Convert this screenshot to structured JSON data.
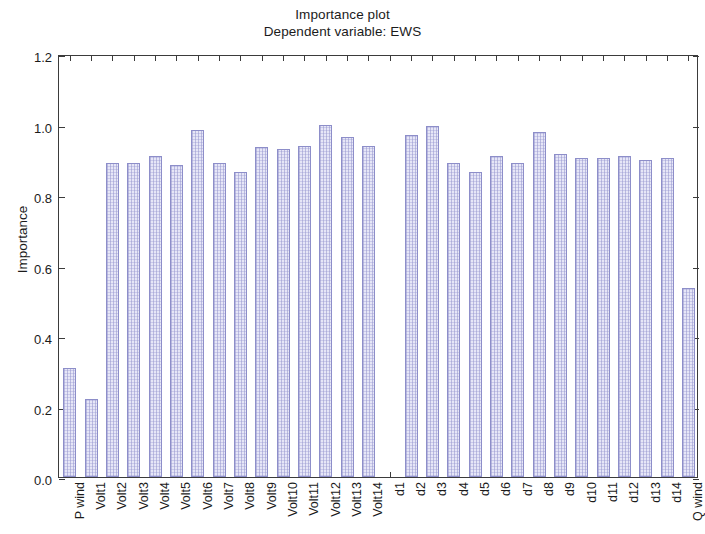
{
  "chart_data": {
    "type": "bar",
    "title": "Importance plot",
    "subtitle": "Dependent variable: EWS",
    "xlabel": "",
    "ylabel": "Importance",
    "ylim": [
      0.0,
      1.2
    ],
    "yticks": [
      "0.0",
      "0.2",
      "0.4",
      "0.6",
      "0.8",
      "1.0",
      "1.2"
    ],
    "ytick_values": [
      0.0,
      0.2,
      0.4,
      0.6,
      0.8,
      1.0,
      1.2
    ],
    "grid": false,
    "legend": "none",
    "bar_fill_color": "#e6e6f7",
    "bar_edge_color": "#8d8ec9",
    "categories": [
      "P wind",
      "Volt1",
      "Volt2",
      "Volt3",
      "Volt4",
      "Volt5",
      "Volt6",
      "Volt7",
      "Volt8",
      "Volt9",
      "Volt10",
      "Volt11",
      "Volt12",
      "Volt13",
      "Volt14",
      "d1",
      "d2",
      "d3",
      "d4",
      "d5",
      "d6",
      "d7",
      "d8",
      "d9",
      "d10",
      "d11",
      "d12",
      "d13",
      "d14",
      "Q wind"
    ],
    "values": [
      0.31,
      0.22,
      0.89,
      0.89,
      0.91,
      0.885,
      0.985,
      0.89,
      0.865,
      0.935,
      0.93,
      0.94,
      1.0,
      0.965,
      0.94,
      0.0,
      0.97,
      0.995,
      0.89,
      0.865,
      0.91,
      0.89,
      0.98,
      0.915,
      0.905,
      0.905,
      0.91,
      0.9,
      0.905,
      0.535
    ]
  }
}
